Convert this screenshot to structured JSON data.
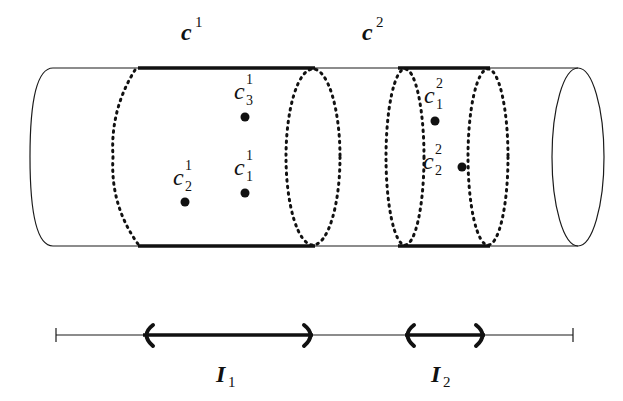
{
  "figure": {
    "type": "cylinder-with-intervals",
    "colors": {
      "stroke": "#1a1a1a",
      "background": "#ffffff"
    }
  },
  "clusters": [
    {
      "label": "c",
      "superscript": "1"
    },
    {
      "label": "c",
      "superscript": "2"
    }
  ],
  "points": [
    {
      "label": "c",
      "sub": "3",
      "sup": "1"
    },
    {
      "label": "c",
      "sub": "1",
      "sup": "1"
    },
    {
      "label": "c",
      "sub": "2",
      "sup": "1"
    },
    {
      "label": "c",
      "sub": "1",
      "sup": "2"
    },
    {
      "label": "c",
      "sub": "2",
      "sup": "2"
    }
  ],
  "intervals": [
    {
      "label": "I",
      "sub": "1"
    },
    {
      "label": "I",
      "sub": "2"
    }
  ]
}
